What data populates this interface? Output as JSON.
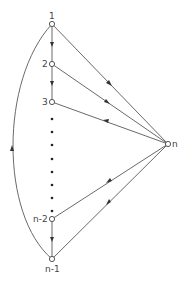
{
  "diagram": {
    "type": "directed-graph",
    "colors": {
      "edge": "#6a6a6a",
      "node_stroke": "#555555",
      "arrow": "#333333",
      "background": "#ffffff"
    },
    "nodes": [
      {
        "id": "1",
        "label": "1",
        "x": 52,
        "y": 24
      },
      {
        "id": "2",
        "label": "2",
        "x": 52,
        "y": 64
      },
      {
        "id": "3",
        "label": "3",
        "x": 52,
        "y": 102
      },
      {
        "id": "n-2",
        "label": "n-2",
        "x": 52,
        "y": 219
      },
      {
        "id": "n-1",
        "label": "n-1",
        "x": 52,
        "y": 259
      },
      {
        "id": "n",
        "label": "n",
        "x": 168,
        "y": 144
      }
    ],
    "edges": [
      {
        "from": "1",
        "to": "2"
      },
      {
        "from": "2",
        "to": "3"
      },
      {
        "from": "n-2",
        "to": "n-1"
      },
      {
        "from": "1",
        "to": "n"
      },
      {
        "from": "2",
        "to": "n"
      },
      {
        "from": "n",
        "to": "3"
      },
      {
        "from": "n",
        "to": "n-2"
      },
      {
        "from": "n",
        "to": "n-1"
      },
      {
        "from": "n-1",
        "to": "1",
        "curved": true
      }
    ],
    "ellipsis": "vertical dots between node 3 and node n-2"
  }
}
